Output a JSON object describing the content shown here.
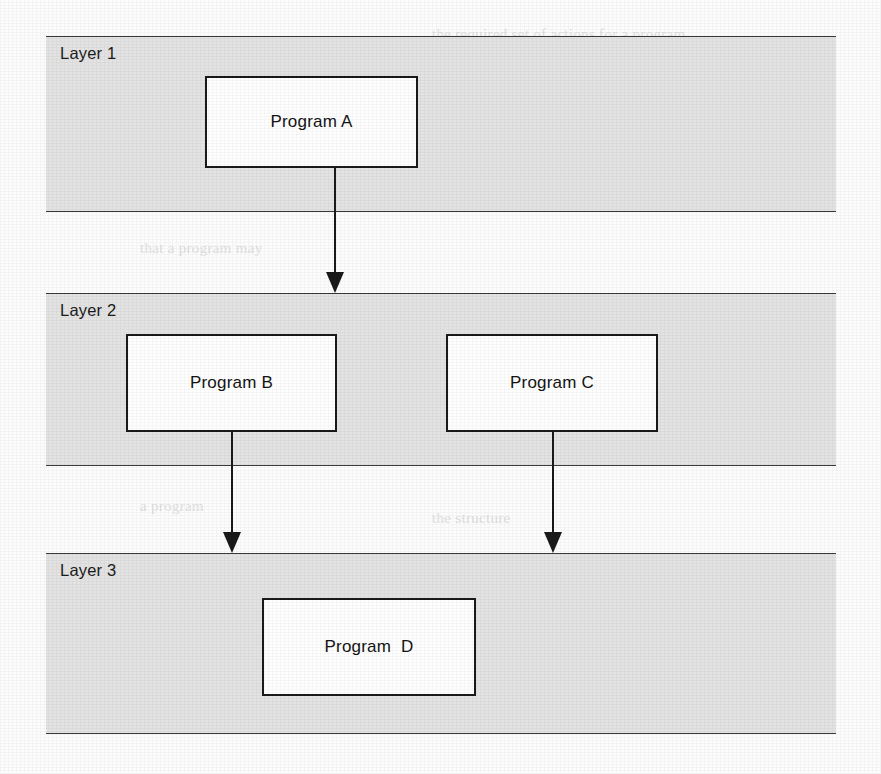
{
  "diagram": {
    "canvas": {
      "width": 881,
      "height": 774
    },
    "colors": {
      "band_fill": "#e3e3e3",
      "band_border": "#3a3a3a",
      "box_fill": "#ffffff",
      "box_border": "#1a1a1a",
      "arrow": "#1a1a1a",
      "text": "#141414",
      "page_background": "#fdfdfd"
    },
    "layers": [
      {
        "id": "layer-1",
        "label": "Layer 1",
        "x": 46,
        "y": 36,
        "width": 790,
        "height": 176
      },
      {
        "id": "layer-2",
        "label": "Layer 2",
        "x": 46,
        "y": 293,
        "width": 790,
        "height": 173
      },
      {
        "id": "layer-3",
        "label": "Layer 3",
        "x": 46,
        "y": 553,
        "width": 790,
        "height": 181
      }
    ],
    "boxes": [
      {
        "id": "program-a",
        "label": "Program A",
        "layer": "layer-1",
        "x": 205,
        "y": 76,
        "width": 213,
        "height": 92
      },
      {
        "id": "program-b",
        "label": "Program B",
        "layer": "layer-2",
        "x": 126,
        "y": 334,
        "width": 211,
        "height": 98
      },
      {
        "id": "program-c",
        "label": "Program C",
        "layer": "layer-2",
        "x": 446,
        "y": 334,
        "width": 212,
        "height": 98
      },
      {
        "id": "program-d",
        "label": "Program  D",
        "layer": "layer-3",
        "x": 262,
        "y": 598,
        "width": 214,
        "height": 98
      }
    ],
    "connectors": [
      {
        "id": "arrow-a-to-layer2",
        "from": "program-a",
        "to": "layer-2",
        "x": 335,
        "y_start": 168,
        "y_end": 293
      },
      {
        "id": "arrow-b-to-layer3",
        "from": "program-b",
        "to": "layer-3",
        "x": 232,
        "y_start": 432,
        "y_end": 553
      },
      {
        "id": "arrow-c-to-layer3",
        "from": "program-c",
        "to": "layer-3",
        "x": 553,
        "y_start": 432,
        "y_end": 553
      }
    ],
    "background_showthrough": [
      {
        "text": "the required set of actions for a program",
        "x": 432,
        "y": 26,
        "size": 15,
        "bold": false
      },
      {
        "text": "shown that rules in ES can be",
        "x": 432,
        "y": 52,
        "size": 15,
        "bold": false
      },
      {
        "text": "following manner; they form a",
        "x": 432,
        "y": 78,
        "size": 15,
        "bold": false
      },
      {
        "text": "If a program, its input is",
        "x": 432,
        "y": 104,
        "size": 15,
        "bold": false
      },
      {
        "text": "that a program may",
        "x": 140,
        "y": 240,
        "size": 15,
        "bold": false
      },
      {
        "text": "the placed in the",
        "x": 432,
        "y": 344,
        "size": 15,
        "bold": false
      },
      {
        "text": "any layer",
        "x": 432,
        "y": 398,
        "size": 15,
        "bold": true
      },
      {
        "text": "a program",
        "x": 140,
        "y": 498,
        "size": 15,
        "bold": false
      },
      {
        "text": "the structure",
        "x": 432,
        "y": 510,
        "size": 15,
        "bold": false
      }
    ]
  }
}
